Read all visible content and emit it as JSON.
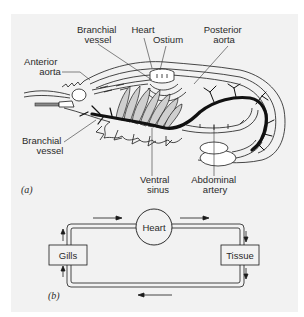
{
  "figure_a": {
    "panel_label": "(a)",
    "labels": {
      "branchial_vessel_top_1": "Branchial",
      "branchial_vessel_top_2": "vessel",
      "heart": "Heart",
      "ostium": "Ostium",
      "posterior_aorta_1": "Posterior",
      "posterior_aorta_2": "aorta",
      "anterior_aorta_1": "Anterior",
      "anterior_aorta_2": "aorta",
      "branchial_vessel_left_1": "Branchial",
      "branchial_vessel_left_2": "vessel",
      "ventral_sinus_1": "Ventral",
      "ventral_sinus_2": "sinus",
      "abdominal_artery_1": "Abdominal",
      "abdominal_artery_2": "artery"
    }
  },
  "figure_b": {
    "panel_label": "(b)",
    "nodes": {
      "heart": "Heart",
      "gills": "Gills",
      "tissue": "Tissue"
    },
    "flow": [
      "Heart",
      "Tissue",
      "Gills",
      "Heart"
    ]
  },
  "colors": {
    "background": "#ffffff",
    "panel": "#f2f2f2",
    "ink": "#1a1a1a"
  }
}
